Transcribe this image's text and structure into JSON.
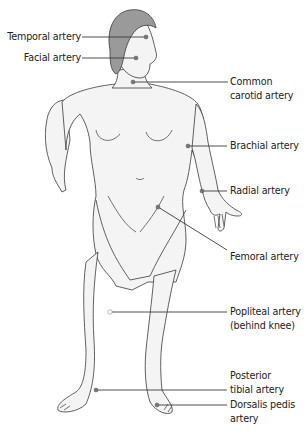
{
  "figure": {
    "colors": {
      "skin_fill": "#f4f4f4",
      "outline": "#3a3a3a",
      "hair": "#9a9a9a",
      "leader_line": "#3a3a3a",
      "pulse_dot": "#777777",
      "text": "#222222"
    }
  },
  "labels": {
    "temporal": "Temporal artery",
    "facial": "Facial artery",
    "carotid_1": "Common",
    "carotid_2": "carotid artery",
    "brachial": "Brachial artery",
    "radial": "Radial artery",
    "femoral": "Femoral artery",
    "popliteal_1": "Popliteal artery",
    "popliteal_2": "(behind knee)",
    "tibial_1": "Posterior",
    "tibial_2": "tibial artery",
    "dorsalis_1": "Dorsalis pedis",
    "dorsalis_2": "artery"
  }
}
